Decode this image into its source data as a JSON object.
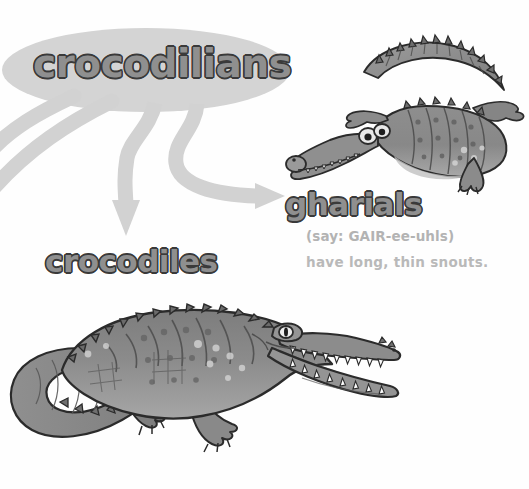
{
  "page": {
    "background_color": "#fefefe",
    "width": 529,
    "height": 489
  },
  "palette": {
    "branch_gray": "#d2d2d2",
    "ellipse_gray": "#d4d4d4",
    "heading_fill": "#8f8f8f",
    "heading_outline": "#2e2e2e",
    "body_text_gray": "#b3b3b3",
    "animal_body": "#8a8a8a",
    "animal_dark": "#6a6a6a",
    "animal_light": "#b5b5b5",
    "animal_outline": "#2b2b2b",
    "teeth_white": "#fbfbfb"
  },
  "diagram": {
    "root": {
      "label": "crocodilians",
      "shape": "ellipse"
    },
    "branches": [
      {
        "name": "branch-offpage-1",
        "target": "off-page-left",
        "has_arrowhead": false
      },
      {
        "name": "branch-offpage-2",
        "target": "off-page-left",
        "has_arrowhead": false
      },
      {
        "name": "branch-crocodiles",
        "target": "crocodiles",
        "has_arrowhead": true,
        "direction": "down"
      },
      {
        "name": "branch-gharials",
        "target": "gharials",
        "has_arrowhead": true,
        "direction": "right"
      }
    ],
    "nodes": [
      {
        "id": "crocodiles",
        "label": "crocodiles",
        "pronunciation": "",
        "description": "",
        "illustration": "crocodile-illustration"
      },
      {
        "id": "gharials",
        "label": "gharials",
        "pronunciation": "(say: GAIR-ee-uhls)",
        "description": "have long, thin snouts.",
        "illustration": "gharial-illustration"
      }
    ]
  },
  "icons": {
    "gharial": "gharial-icon",
    "crocodile": "crocodile-icon",
    "arrowhead_down": "arrow-down-icon",
    "arrowhead_right": "arrow-right-icon"
  }
}
